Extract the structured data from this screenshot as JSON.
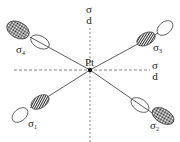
{
  "diagram": {
    "center_label": "Pt",
    "axis_labels": {
      "vertical": {
        "sigma": "σ",
        "sub": "d"
      },
      "horizontal": {
        "sigma": "σ",
        "sub": "d"
      }
    },
    "orbitals": [
      {
        "label": "σ",
        "sub": "4"
      },
      {
        "label": "σ",
        "sub": "3"
      },
      {
        "label": "σ",
        "sub": "1"
      },
      {
        "label": "σ",
        "sub": "2"
      }
    ]
  }
}
